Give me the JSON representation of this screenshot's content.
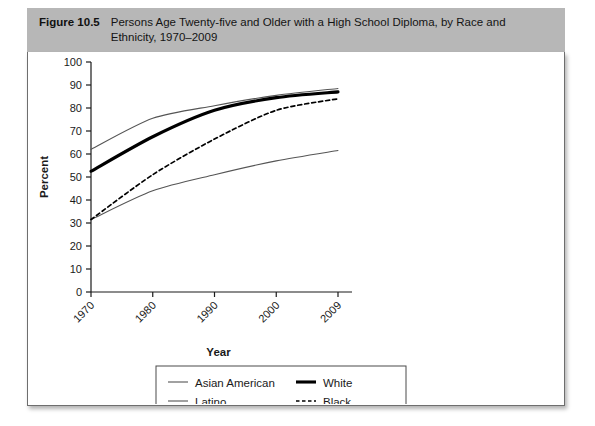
{
  "figure": {
    "number_label": "Figure 10.5",
    "caption": "Persons Age Twenty-five and Older with a High School Diploma, by Race and Ethnicity, 1970–2009",
    "caption_line1": "Persons Age Twenty-five and Older with a High School Diploma, by Race and",
    "caption_line2": "Ethnicity, 1970–2009",
    "header_bg": "#b7b7b7",
    "panel_bg": "#ffffff",
    "border_color": "#6e6e6e"
  },
  "chart_data": {
    "type": "line",
    "title": "Persons Age Twenty-five and Older with a High School Diploma, by Race and Ethnicity, 1970–2009",
    "xlabel": "Year",
    "ylabel": "Percent",
    "categories": [
      "1970",
      "1980",
      "1990",
      "2000",
      "2009"
    ],
    "x": [
      1970,
      1980,
      1990,
      2000,
      2009
    ],
    "xtick_labels": [
      "1970",
      "1980",
      "1990",
      "2000",
      "2009"
    ],
    "ytick_labels": [
      "0",
      "10",
      "20",
      "30",
      "40",
      "50",
      "60",
      "70",
      "80",
      "90",
      "100"
    ],
    "ytick_values": [
      0,
      10,
      20,
      30,
      40,
      50,
      60,
      70,
      80,
      90,
      100
    ],
    "ylim": [
      0,
      100
    ],
    "grid": false,
    "legend_position": "bottom",
    "series": [
      {
        "name": "Asian American",
        "values": [
          62,
          75.5,
          81,
          85.5,
          88.5
        ],
        "style": "thin-solid",
        "color": "#555555",
        "stroke_width": 1.1
      },
      {
        "name": "White",
        "values": [
          52.5,
          67.5,
          79,
          84.5,
          87
        ],
        "style": "thick-solid",
        "color": "#000000",
        "stroke_width": 3.1
      },
      {
        "name": "Latino",
        "values": [
          31.5,
          44,
          51,
          57,
          61.5
        ],
        "style": "thin-solid",
        "color": "#555555",
        "stroke_width": 1.1
      },
      {
        "name": "Black",
        "values": [
          31.5,
          51,
          66.5,
          79,
          84
        ],
        "style": "dashed",
        "color": "#000000",
        "stroke_width": 1.7
      }
    ]
  },
  "legend": {
    "entries": [
      {
        "label": "Asian American",
        "style": "thin-solid"
      },
      {
        "label": "White",
        "style": "thick-solid"
      },
      {
        "label": "Latino",
        "style": "thin-solid"
      },
      {
        "label": "Black",
        "style": "dashed"
      }
    ]
  }
}
